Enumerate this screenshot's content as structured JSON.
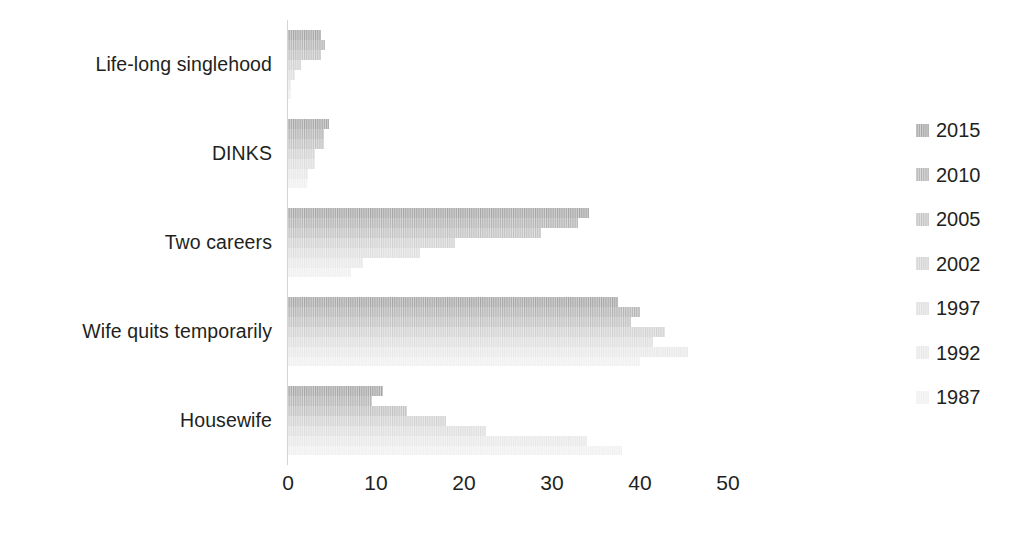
{
  "chart_data": {
    "type": "bar",
    "orientation": "horizontal",
    "title": "",
    "subtitle": "",
    "xlabel": "",
    "ylabel": "",
    "xlim": [
      0,
      52
    ],
    "xticks": [
      0,
      10,
      20,
      30,
      40,
      50
    ],
    "xtick_labels": [
      "0",
      "10",
      "20",
      "30",
      "40",
      "50"
    ],
    "grid": false,
    "legend_position": "right",
    "categories": [
      "Life-long singlehood",
      "DINKS",
      "Two careers",
      "Wife quits temporarily",
      "Housewife"
    ],
    "series": [
      {
        "name": "2015",
        "color": "#a6a6a6",
        "values": [
          3.8,
          4.7,
          34.2,
          37.5,
          10.8
        ]
      },
      {
        "name": "2010",
        "color": "#b4b4b4",
        "values": [
          4.2,
          4.1,
          33.0,
          40.0,
          9.5
        ]
      },
      {
        "name": "2005",
        "color": "#c2c2c2",
        "values": [
          3.8,
          4.1,
          28.8,
          39.0,
          13.5
        ]
      },
      {
        "name": "2002",
        "color": "#d2d2d2",
        "values": [
          1.5,
          3.1,
          19.0,
          42.8,
          18.0
        ]
      },
      {
        "name": "1997",
        "color": "#dedede",
        "values": [
          0.8,
          3.1,
          15.0,
          41.5,
          22.5
        ]
      },
      {
        "name": "1992",
        "color": "#e8e8e8",
        "values": [
          0.3,
          2.3,
          8.5,
          45.5,
          34.0
        ]
      },
      {
        "name": "1987",
        "color": "#f0f0f0",
        "values": [
          0.3,
          2.2,
          7.2,
          40.0,
          38.0
        ]
      }
    ]
  },
  "legend": {
    "entries": [
      {
        "label": "2015"
      },
      {
        "label": "2010"
      },
      {
        "label": "2005"
      },
      {
        "label": "2002"
      },
      {
        "label": "1997"
      },
      {
        "label": "1992"
      },
      {
        "label": "1987"
      }
    ]
  },
  "colors": {
    "text": "#231f20",
    "axis_line": "#d4d4d4",
    "background": "#ffffff"
  }
}
